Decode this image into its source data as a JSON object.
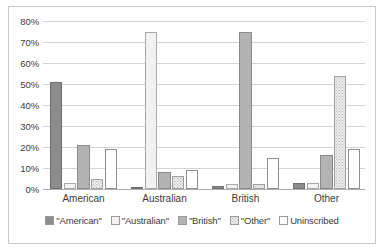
{
  "chart_data": {
    "type": "bar",
    "title": "",
    "subtitle": "",
    "xlabel": "",
    "ylabel": "",
    "ylim": [
      0,
      80
    ],
    "ytick_step": 10,
    "ytick_labels": [
      "0%",
      "10%",
      "20%",
      "30%",
      "40%",
      "50%",
      "60%",
      "70%",
      "80%"
    ],
    "ytick_values": [
      0,
      10,
      20,
      30,
      40,
      50,
      60,
      70,
      80
    ],
    "grid": "horizontal",
    "legend_position": "bottom",
    "categories": [
      "American",
      "Australian",
      "British",
      "Other"
    ],
    "series": [
      {
        "name": "\"American\"",
        "values": [
          51,
          0.5,
          1.5,
          3
        ]
      },
      {
        "name": "\"Australian\"",
        "values": [
          3,
          75,
          2.5,
          3
        ]
      },
      {
        "name": "\"British\"",
        "values": [
          21,
          8,
          75,
          16
        ]
      },
      {
        "name": "\"Other\"",
        "values": [
          5,
          6,
          2.5,
          54
        ]
      },
      {
        "name": "Uninscribed",
        "values": [
          19,
          9,
          15,
          19
        ]
      }
    ],
    "series_colors": [
      "#8c8c8c",
      "#f2f2f2",
      "#b3b3b3",
      "#ececec",
      "#ffffff"
    ]
  },
  "legend": {
    "items": [
      {
        "label": "\"American\"",
        "swatch": "american-swatch"
      },
      {
        "label": "\"Australian\"",
        "swatch": "australian-swatch"
      },
      {
        "label": "\"British\"",
        "swatch": "british-swatch"
      },
      {
        "label": "\"Other\"",
        "swatch": "other-swatch"
      },
      {
        "label": "Uninscribed",
        "swatch": "uninscribed-swatch"
      }
    ]
  }
}
